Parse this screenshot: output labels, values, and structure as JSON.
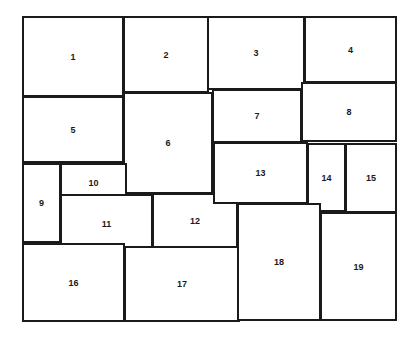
{
  "diagram": {
    "type": "rectangle-packing-layout",
    "tiles": [
      {
        "label": "1",
        "x": 22,
        "y": 16,
        "w": 102,
        "h": 81
      },
      {
        "label": "2",
        "x": 123,
        "y": 16,
        "w": 86,
        "h": 77
      },
      {
        "label": "3",
        "x": 207,
        "y": 16,
        "w": 98,
        "h": 74
      },
      {
        "label": "4",
        "x": 304,
        "y": 16,
        "w": 93,
        "h": 67
      },
      {
        "label": "5",
        "x": 22,
        "y": 96,
        "w": 102,
        "h": 67
      },
      {
        "label": "6",
        "x": 123,
        "y": 92,
        "w": 90,
        "h": 102
      },
      {
        "label": "7",
        "x": 212,
        "y": 89,
        "w": 90,
        "h": 54
      },
      {
        "label": "8",
        "x": 301,
        "y": 82,
        "w": 96,
        "h": 60
      },
      {
        "label": "9",
        "x": 22,
        "y": 163,
        "w": 39,
        "h": 80
      },
      {
        "label": "10",
        "x": 60,
        "y": 163,
        "w": 67,
        "h": 40
      },
      {
        "label": "11",
        "x": 60,
        "y": 194,
        "w": 93,
        "h": 60
      },
      {
        "label": "12",
        "x": 152,
        "y": 193,
        "w": 86,
        "h": 55
      },
      {
        "label": "13",
        "x": 213,
        "y": 142,
        "w": 95,
        "h": 62
      },
      {
        "label": "14",
        "x": 307,
        "y": 143,
        "w": 39,
        "h": 69
      },
      {
        "label": "15",
        "x": 345,
        "y": 143,
        "w": 52,
        "h": 70
      },
      {
        "label": "16",
        "x": 22,
        "y": 243,
        "w": 103,
        "h": 79
      },
      {
        "label": "17",
        "x": 124,
        "y": 246,
        "w": 116,
        "h": 76
      },
      {
        "label": "18",
        "x": 237,
        "y": 203,
        "w": 84,
        "h": 118
      },
      {
        "label": "19",
        "x": 320,
        "y": 212,
        "w": 77,
        "h": 109
      }
    ],
    "colors": {
      "stroke": "#1a1a1a",
      "fill": "#ffffff",
      "background": "#ffffff"
    }
  }
}
